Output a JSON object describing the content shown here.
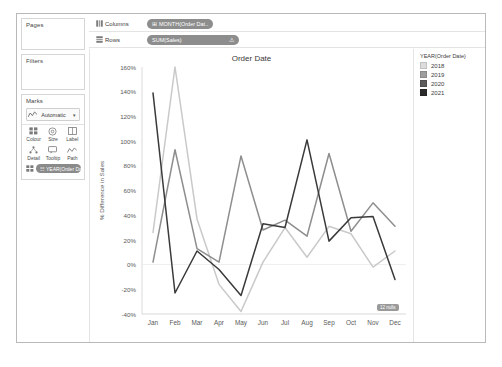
{
  "window": {
    "title": ""
  },
  "cards": {
    "pages": {
      "title": "Pages"
    },
    "filters": {
      "title": "Filters"
    },
    "marks": {
      "title": "Marks",
      "mark_type": "Automatic",
      "mark_type_icon": "line-mark-icon",
      "caret": "▾",
      "buttons": [
        {
          "label": "Colour",
          "icon": "colour-icon"
        },
        {
          "label": "Size",
          "icon": "size-icon"
        },
        {
          "label": "Label",
          "icon": "label-icon"
        },
        {
          "label": "Detail",
          "icon": "detail-icon"
        },
        {
          "label": "Tooltip",
          "icon": "tooltip-icon"
        },
        {
          "label": "Path",
          "icon": "path-icon"
        }
      ],
      "colour_pill": {
        "label": "YEAR(Order Date)",
        "icon": "☷"
      }
    }
  },
  "shelves": {
    "columns": {
      "name": "Columns",
      "icon": "columns-icon",
      "pill": {
        "label": "MONTH(Order Dat..",
        "icon": "⊞"
      }
    },
    "rows": {
      "name": "Rows",
      "icon": "rows-icon",
      "pill": {
        "label": "SUM(Sales)",
        "warning": "⚠"
      }
    }
  },
  "legend": {
    "title": "YEAR(Order Date)",
    "items": [
      {
        "label": "2018",
        "color": "#dcdcdc"
      },
      {
        "label": "2019",
        "color": "#9e9e9e"
      },
      {
        "label": "2020",
        "color": "#5c5c5c"
      },
      {
        "label": "2021",
        "color": "#2b2b2b"
      }
    ]
  },
  "nulls_badge": {
    "label": "12 nulls"
  },
  "chart_data": {
    "type": "line",
    "title": "Order Date",
    "xlabel": "",
    "ylabel": "% Difference in Sales",
    "categories": [
      "Jan",
      "Feb",
      "Mar",
      "Apr",
      "May",
      "Jun",
      "Jul",
      "Aug",
      "Sep",
      "Oct",
      "Nov",
      "Dec"
    ],
    "ylim": [
      -40,
      160
    ],
    "ytick_step": 20,
    "ytick_labels": [
      "160%",
      "140%",
      "120%",
      "100%",
      "80%",
      "60%",
      "40%",
      "20%",
      "0%",
      "-20%",
      "-40%"
    ],
    "grid": false,
    "legend_position": "right",
    "series": [
      {
        "name": "2018",
        "color": "#dcdcdc",
        "values": [
          null,
          null,
          null,
          null,
          null,
          null,
          null,
          null,
          null,
          null,
          null,
          null
        ]
      },
      {
        "name": "2019",
        "color": "#c9c9c9",
        "values": [
          26,
          160,
          37,
          -16,
          -38,
          2,
          30,
          6,
          31,
          25,
          -2,
          11
        ]
      },
      {
        "name": "2020",
        "color": "#8e8e8e",
        "values": [
          2,
          93,
          13,
          2,
          88,
          28,
          36,
          23,
          90,
          27,
          50,
          31
        ]
      },
      {
        "name": "2021",
        "color": "#3a3a3a",
        "values": [
          139,
          -23,
          11,
          -4,
          -25,
          33,
          30,
          101,
          19,
          38,
          39,
          -12
        ]
      }
    ]
  }
}
